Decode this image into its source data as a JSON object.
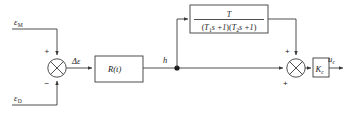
{
  "diagram": {
    "type": "control-block-diagram",
    "background_color": "#ffffff",
    "line_color": "#3a3a3a",
    "text_color": "#1a1a1a",
    "inputs": [
      {
        "id": "eps_m",
        "base": "ε",
        "subscript": "M",
        "sign": "+",
        "position": "top-left"
      },
      {
        "id": "eps_d",
        "base": "ε",
        "subscript": "D",
        "sign": "−",
        "position": "bottom-left"
      }
    ],
    "signals": {
      "error": {
        "label": "Δε",
        "description": "error signal out of first summing junction"
      },
      "plant_out": {
        "label": "h",
        "description": "output of R(t) block, branch point"
      },
      "output": {
        "base": "u",
        "subscript": "c",
        "description": "final control output"
      }
    },
    "blocks": [
      {
        "id": "transfer-function",
        "kind": "fraction",
        "numerator": "T",
        "denominator_parts": [
          {
            "base": "T",
            "subscript": "1",
            "tail": "s +1"
          },
          {
            "base": "T",
            "subscript": "2",
            "tail": "s +1"
          }
        ],
        "denominator_text": "(T₁s +1)(T₂s +1)",
        "position": "top-middle"
      },
      {
        "id": "plant",
        "kind": "label",
        "label_base": "R",
        "label_arg": "(t)",
        "label_text": "R(t)",
        "position": "middle-left"
      },
      {
        "id": "gain",
        "kind": "label",
        "label_base": "K",
        "label_subscript": "c",
        "label_text": "Kc",
        "position": "middle-right"
      }
    ],
    "summing_junctions": [
      {
        "id": "junction-1",
        "signs": {
          "top": "+",
          "bottom": "−"
        },
        "position": "left"
      },
      {
        "id": "junction-2",
        "signs": {
          "top": "+",
          "bottom_left": "+"
        },
        "position": "right"
      }
    ]
  }
}
